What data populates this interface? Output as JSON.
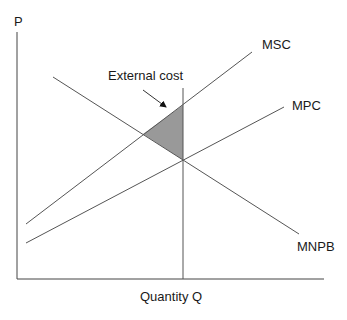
{
  "diagram": {
    "type": "economics-externality",
    "axes": {
      "y_label": "P",
      "x_label": "Quantity Q"
    },
    "curves": [
      {
        "id": "msc",
        "label": "MSC",
        "x1": 26,
        "y1": 224,
        "x2": 252,
        "y2": 52,
        "label_x": 262,
        "label_y": 49
      },
      {
        "id": "mpc",
        "label": "MPC",
        "x1": 26,
        "y1": 243,
        "x2": 284,
        "y2": 107,
        "label_x": 292,
        "label_y": 110
      },
      {
        "id": "mnpb",
        "label": "MNPB",
        "x1": 53,
        "y1": 77,
        "x2": 299,
        "y2": 234,
        "label_x": 297,
        "label_y": 251
      }
    ],
    "annotation": {
      "label": "External cost",
      "label_x": 108,
      "label_y": 80,
      "arrow_from": [
        143,
        90
      ],
      "arrow_to": [
        168,
        109
      ]
    },
    "shaded_region": {
      "name": "external cost triangle",
      "points": [
        [
          183,
          105
        ],
        [
          143,
          134
        ],
        [
          183,
          160
        ]
      ],
      "color": "#999999"
    },
    "quantity_line_x": 183,
    "colors": {
      "line": "#555555",
      "axis": "#444444",
      "fill": "#999999",
      "text": "#1a1a1a"
    }
  }
}
